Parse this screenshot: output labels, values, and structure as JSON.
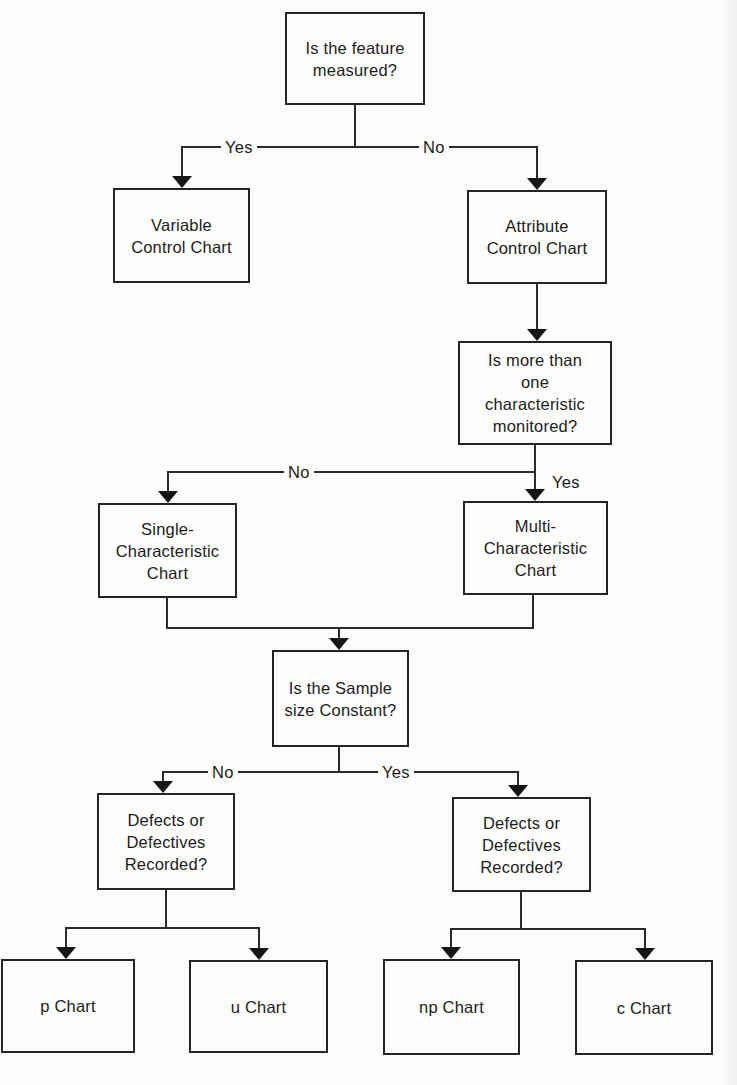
{
  "diagram": {
    "type": "flowchart-decision-tree",
    "colors": {
      "background": "#fcfcfa",
      "line": "#2a2a2a",
      "box_border": "#242424",
      "text": "#1c1c1c"
    },
    "nodes": {
      "q_measured": {
        "label": "Is the feature\nmeasured?"
      },
      "variable": {
        "label": "Variable\nControl Chart"
      },
      "attribute": {
        "label": "Attribute\nControl Chart"
      },
      "q_multi": {
        "label": "Is more than\none\ncharacteristic\nmonitored?"
      },
      "single": {
        "label": "Single-\nCharacteristic\nChart"
      },
      "multi": {
        "label": "Multi-\nCharacteristic\nChart"
      },
      "q_sample": {
        "label": "Is the Sample\nsize Constant?"
      },
      "defects_left": {
        "label": "Defects or\nDefectives\nRecorded?"
      },
      "defects_right": {
        "label": "Defects or\nDefectives\nRecorded?"
      },
      "p_chart": {
        "label": "p Chart"
      },
      "u_chart": {
        "label": "u Chart"
      },
      "np_chart": {
        "label": "np Chart"
      },
      "c_chart": {
        "label": "c Chart"
      }
    },
    "edge_labels": {
      "measured_yes": "Yes",
      "measured_no": "No",
      "multi_no": "No",
      "multi_yes": "Yes",
      "sample_no": "No",
      "sample_yes": "Yes"
    }
  }
}
